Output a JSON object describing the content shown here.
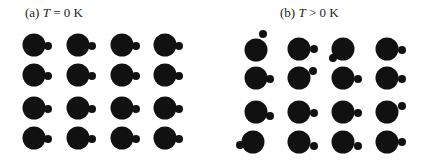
{
  "colors": {
    "atom": "#111111",
    "background": "#ffffff",
    "text": "#222222"
  },
  "panels": [
    {
      "id": "a",
      "label": "(a)",
      "symbol": "T",
      "relation": "=",
      "value": "0 K",
      "caption_pos": [
        25,
        5
      ],
      "big_radius": 11.5,
      "small_radius": 4,
      "atoms": [
        {
          "cx": 34,
          "cy": 45,
          "sx": 48,
          "sy": 46
        },
        {
          "cx": 78,
          "cy": 45,
          "sx": 92,
          "sy": 46
        },
        {
          "cx": 122,
          "cy": 45,
          "sx": 136,
          "sy": 46
        },
        {
          "cx": 165,
          "cy": 45,
          "sx": 179,
          "sy": 46
        },
        {
          "cx": 34,
          "cy": 75,
          "sx": 48,
          "sy": 76
        },
        {
          "cx": 78,
          "cy": 75,
          "sx": 92,
          "sy": 76
        },
        {
          "cx": 122,
          "cy": 75,
          "sx": 136,
          "sy": 76
        },
        {
          "cx": 165,
          "cy": 75,
          "sx": 179,
          "sy": 76
        },
        {
          "cx": 34,
          "cy": 108,
          "sx": 48,
          "sy": 109
        },
        {
          "cx": 78,
          "cy": 108,
          "sx": 92,
          "sy": 109
        },
        {
          "cx": 122,
          "cy": 108,
          "sx": 136,
          "sy": 109
        },
        {
          "cx": 165,
          "cy": 108,
          "sx": 179,
          "sy": 109
        },
        {
          "cx": 34,
          "cy": 138,
          "sx": 48,
          "sy": 139
        },
        {
          "cx": 78,
          "cy": 138,
          "sx": 92,
          "sy": 139
        },
        {
          "cx": 122,
          "cy": 138,
          "sx": 136,
          "sy": 139
        },
        {
          "cx": 165,
          "cy": 138,
          "sx": 179,
          "sy": 139
        }
      ]
    },
    {
      "id": "b",
      "label": "(b)",
      "symbol": "T",
      "relation": ">",
      "value": "0 K",
      "caption_pos": [
        280,
        5
      ],
      "big_radius": 11.5,
      "small_radius": 4,
      "atoms": [
        {
          "cx": 256,
          "cy": 50,
          "sx": 263,
          "sy": 34
        },
        {
          "cx": 299,
          "cy": 49,
          "sx": 314,
          "sy": 49
        },
        {
          "cx": 343,
          "cy": 49,
          "sx": 333,
          "sy": 58
        },
        {
          "cx": 387,
          "cy": 49,
          "sx": 402,
          "sy": 50
        },
        {
          "cx": 256,
          "cy": 78,
          "sx": 270,
          "sy": 79
        },
        {
          "cx": 299,
          "cy": 78,
          "sx": 313,
          "sy": 71
        },
        {
          "cx": 343,
          "cy": 78,
          "sx": 358,
          "sy": 79
        },
        {
          "cx": 387,
          "cy": 78,
          "sx": 402,
          "sy": 79
        },
        {
          "cx": 256,
          "cy": 112,
          "sx": 270,
          "sy": 116
        },
        {
          "cx": 299,
          "cy": 112,
          "sx": 314,
          "sy": 113
        },
        {
          "cx": 343,
          "cy": 112,
          "sx": 358,
          "sy": 113
        },
        {
          "cx": 387,
          "cy": 112,
          "sx": 402,
          "sy": 106
        },
        {
          "cx": 253,
          "cy": 142,
          "sx": 240,
          "sy": 145
        },
        {
          "cx": 299,
          "cy": 142,
          "sx": 314,
          "sy": 146
        },
        {
          "cx": 343,
          "cy": 142,
          "sx": 358,
          "sy": 146
        },
        {
          "cx": 387,
          "cy": 142,
          "sx": 402,
          "sy": 142
        }
      ]
    }
  ]
}
